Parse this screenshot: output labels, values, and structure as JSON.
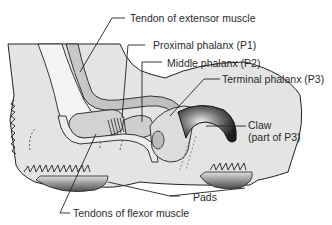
{
  "diagram": {
    "labels": {
      "extensor": "Tendon of extensor muscle",
      "p1": "Proximal phalanx (P1)",
      "p2": "Middle phalanx (P2)",
      "p3": "Terminal phalanx (P3)",
      "claw_line1": "Claw",
      "claw_line2": "(part of P3)",
      "pads": "Pads",
      "flexor": "Tendons of flexor muscle"
    },
    "colors": {
      "skin_fill": "#e3e3e3",
      "outline": "#222222",
      "bone_fill": "#d4d4d4",
      "claw_dark": "#333333",
      "pad_dark": "#555555",
      "text": "#2a2a2a"
    }
  }
}
